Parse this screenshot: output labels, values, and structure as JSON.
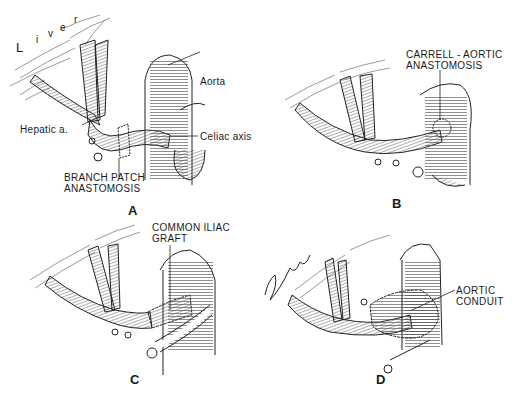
{
  "figure": {
    "panels": [
      {
        "id": "A",
        "caption": "A",
        "labels": {
          "liver": [
            "L",
            "i",
            "v",
            "e",
            "r"
          ],
          "aorta": "Aorta",
          "hepatic": "Hepatic a.",
          "celiac": "Celiac axis",
          "branch_patch_1": "BRANCH PATCH",
          "branch_patch_2": "ANASTOMOSIS"
        }
      },
      {
        "id": "B",
        "caption": "B",
        "labels": {
          "line1": "CARRELL - AORTIC",
          "line2": "ANASTOMOSIS"
        }
      },
      {
        "id": "C",
        "caption": "C",
        "labels": {
          "line1": "COMMON ILIAC",
          "line2": "GRAFT"
        }
      },
      {
        "id": "D",
        "caption": "D",
        "labels": {
          "line1": "AORTIC",
          "line2": "CONDUIT",
          "signature": "Sforza"
        }
      }
    ]
  }
}
